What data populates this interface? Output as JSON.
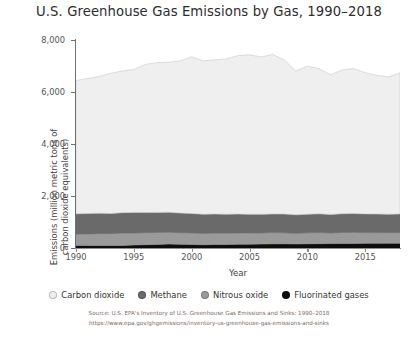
{
  "chart_data": {
    "type": "area",
    "title": "U.S. Greenhouse Gas Emissions by Gas, 1990–2018",
    "xlabel": "Year",
    "ylabel": "Emissions (million metric tons of carbon dioxide equivalents)",
    "ylabel_line1": "Emissions (million metric tons of",
    "ylabel_line2": "carbon dioxide equivalents)",
    "xlim": [
      1990,
      2018
    ],
    "ylim": [
      0,
      8000
    ],
    "ytick_labels": [
      "0",
      "2,000",
      "4,000",
      "6,000",
      "8,000"
    ],
    "ytick_values": [
      0,
      2000,
      4000,
      6000,
      8000
    ],
    "xtick_labels": [
      "1990",
      "1995",
      "2000",
      "2005",
      "2010",
      "2015"
    ],
    "xtick_values": [
      1990,
      1995,
      2000,
      2005,
      2010,
      2015
    ],
    "grid": false,
    "stacked": true,
    "legend_position": "bottom",
    "x": [
      1990,
      1991,
      1992,
      1993,
      1994,
      1995,
      1996,
      1997,
      1998,
      1999,
      2000,
      2001,
      2002,
      2003,
      2004,
      2005,
      2006,
      2007,
      2008,
      2009,
      2010,
      2011,
      2012,
      2013,
      2014,
      2015,
      2016,
      2017,
      2018
    ],
    "series": [
      {
        "name": "Fluorinated gases",
        "color": "#0d0d0d",
        "values": [
          100,
          97,
          96,
          95,
          100,
          118,
          128,
          138,
          154,
          140,
          135,
          126,
          135,
          133,
          143,
          147,
          152,
          159,
          161,
          156,
          162,
          168,
          170,
          174,
          176,
          178,
          180,
          182,
          185
        ]
      },
      {
        "name": "Nitrous oxide",
        "color": "#9a9a9a",
        "values": [
          437,
          444,
          456,
          455,
          477,
          460,
          460,
          462,
          454,
          450,
          445,
          436,
          438,
          435,
          438,
          432,
          428,
          433,
          424,
          408,
          421,
          426,
          406,
          424,
          425,
          414,
          412,
          406,
          410
        ]
      },
      {
        "name": "Methane",
        "color": "#6a6a6a",
        "values": [
          780,
          784,
          789,
          776,
          783,
          790,
          779,
          770,
          764,
          754,
          746,
          738,
          735,
          733,
          725,
          718,
          714,
          718,
          722,
          712,
          716,
          721,
          714,
          722,
          726,
          720,
          716,
          713,
          717
        ]
      },
      {
        "name": "Carbon dioxide",
        "color": "#efefef",
        "values": [
          5120,
          5195,
          5259,
          5391,
          5450,
          5497,
          5694,
          5760,
          5774,
          5850,
          6029,
          5896,
          5930,
          5972,
          6095,
          6132,
          6054,
          6131,
          5927,
          5531,
          5700,
          5585,
          5372,
          5530,
          5573,
          5433,
          5333,
          5277,
          5426
        ]
      }
    ],
    "totals": [
      6437,
      6520,
      6600,
      6717,
      6810,
      6865,
      7061,
      7130,
      7146,
      7194,
      7355,
      7196,
      7238,
      7273,
      7401,
      7429,
      7348,
      7441,
      7234,
      6807,
      6999,
      6900,
      6662,
      6850,
      6900,
      6745,
      6641,
      6578,
      6738
    ]
  },
  "legend": {
    "items": [
      {
        "label": "Carbon dioxide",
        "color": "#efefef"
      },
      {
        "label": "Methane",
        "color": "#6a6a6a"
      },
      {
        "label": "Nitrous oxide",
        "color": "#9a9a9a"
      },
      {
        "label": "Fluorinated gases",
        "color": "#0d0d0d"
      }
    ]
  },
  "source": {
    "line1": "Source: U.S. EPA's Inventory of U.S. Greenhouse Gas Emissions and Sinks: 1990–2018",
    "line2": "https://www.epa.gov/ghgemissions/inventory-us-greenhouse-gas-emissions-and-sinks"
  }
}
